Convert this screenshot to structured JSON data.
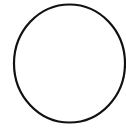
{
  "canvas": {
    "width": 126,
    "height": 131,
    "background": "#ffffff"
  },
  "shape": {
    "type": "ellipse-outline",
    "cx": 69.5,
    "cy": 63.5,
    "rx": 55.5,
    "ry": 59,
    "stroke": "#111111",
    "stroke_width": 2.2,
    "fill": "none"
  }
}
